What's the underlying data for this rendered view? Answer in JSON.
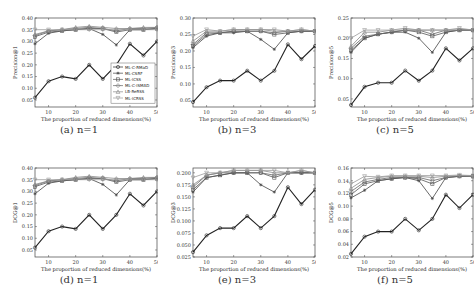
{
  "legend": [
    "ML-C-RMaD",
    "ML-CSRF",
    "ML-ICSS",
    "ML-C-ISMAD",
    "LB-ReRSS",
    "ML-ICRSS"
  ],
  "series_styles": [
    {
      "color": "#222222",
      "marker": "circle"
    },
    {
      "color": "#444444",
      "marker": "star"
    },
    {
      "color": "#555555",
      "marker": "square"
    },
    {
      "color": "#666666",
      "marker": "diamond"
    },
    {
      "color": "#888888",
      "marker": "triangle"
    },
    {
      "color": "#999999",
      "marker": "tri-down"
    }
  ],
  "chart_data": [
    {
      "type": "line",
      "id": "a",
      "caption": "(a)  n=1",
      "xlabel": "The proportion of reduced dimensions(%)",
      "ylabel": "Precision@1",
      "x": [
        5,
        10,
        15,
        20,
        25,
        30,
        35,
        40,
        45,
        50
      ],
      "xticks": [
        10,
        20,
        30,
        40,
        50
      ],
      "ylim": [
        0.02,
        0.4
      ],
      "yticks": [
        "0.05",
        "0.10",
        "0.15",
        "0.20",
        "0.25",
        "0.30",
        "0.35",
        "0.40"
      ],
      "yticks_val": [
        0.05,
        0.1,
        0.15,
        0.2,
        0.25,
        0.3,
        0.35,
        0.4
      ],
      "legend_shown": true,
      "series": [
        {
          "name": "ML-C-RMaD",
          "values": [
            0.06,
            0.13,
            0.15,
            0.14,
            0.2,
            0.14,
            0.2,
            0.29,
            0.24,
            0.3
          ]
        },
        {
          "name": "ML-CSRF",
          "values": [
            0.29,
            0.335,
            0.345,
            0.35,
            0.355,
            0.33,
            0.285,
            0.35,
            0.35,
            0.355
          ]
        },
        {
          "name": "ML-ICSS",
          "values": [
            0.32,
            0.34,
            0.345,
            0.35,
            0.355,
            0.355,
            0.34,
            0.35,
            0.35,
            0.355
          ]
        },
        {
          "name": "ML-C-ISMAD",
          "values": [
            0.325,
            0.345,
            0.35,
            0.355,
            0.36,
            0.355,
            0.345,
            0.355,
            0.355,
            0.36
          ]
        },
        {
          "name": "LB-ReRSS",
          "values": [
            0.33,
            0.345,
            0.35,
            0.36,
            0.365,
            0.36,
            0.355,
            0.355,
            0.36,
            0.36
          ]
        },
        {
          "name": "ML-ICRSS",
          "values": [
            0.35,
            0.35,
            0.35,
            0.35,
            0.35,
            0.35,
            0.35,
            0.35,
            0.35,
            0.35
          ]
        }
      ]
    },
    {
      "type": "line",
      "id": "b",
      "caption": "(b)  n=3",
      "xlabel": "The proportion of reduced dimensions(%)",
      "ylabel": "Precision@3",
      "x": [
        5,
        10,
        15,
        20,
        25,
        30,
        35,
        40,
        45,
        50
      ],
      "xticks": [
        10,
        20,
        30,
        40,
        50
      ],
      "ylim": [
        0.03,
        0.3
      ],
      "yticks": [
        "0.05",
        "0.10",
        "0.15",
        "0.20",
        "0.25",
        "0.30"
      ],
      "yticks_val": [
        0.05,
        0.1,
        0.15,
        0.2,
        0.25,
        0.3
      ],
      "legend_shown": false,
      "series": [
        {
          "name": "ML-C-RMaD",
          "values": [
            0.045,
            0.09,
            0.11,
            0.11,
            0.14,
            0.11,
            0.14,
            0.22,
            0.175,
            0.215
          ]
        },
        {
          "name": "ML-CSRF",
          "values": [
            0.21,
            0.245,
            0.255,
            0.255,
            0.26,
            0.235,
            0.205,
            0.255,
            0.26,
            0.26
          ]
        },
        {
          "name": "ML-ICSS",
          "values": [
            0.215,
            0.25,
            0.255,
            0.26,
            0.26,
            0.26,
            0.25,
            0.255,
            0.26,
            0.26
          ]
        },
        {
          "name": "ML-C-ISMAD",
          "values": [
            0.22,
            0.255,
            0.255,
            0.26,
            0.26,
            0.26,
            0.255,
            0.26,
            0.26,
            0.26
          ]
        },
        {
          "name": "LB-ReRSS",
          "values": [
            0.23,
            0.26,
            0.26,
            0.265,
            0.265,
            0.265,
            0.26,
            0.26,
            0.265,
            0.26
          ]
        },
        {
          "name": "ML-ICRSS",
          "values": [
            0.245,
            0.265,
            0.26,
            0.265,
            0.265,
            0.265,
            0.265,
            0.26,
            0.265,
            0.26
          ]
        }
      ]
    },
    {
      "type": "line",
      "id": "c",
      "caption": "(c)  n=5",
      "xlabel": "The proportion of reduced dimensions(%)",
      "ylabel": "Precision@5",
      "x": [
        5,
        10,
        15,
        20,
        25,
        30,
        35,
        40,
        45,
        50
      ],
      "xticks": [
        10,
        20,
        30,
        40,
        50
      ],
      "ylim": [
        0.03,
        0.25
      ],
      "yticks": [
        "0.05",
        "0.10",
        "0.15",
        "0.20",
        "0.25"
      ],
      "yticks_val": [
        0.05,
        0.1,
        0.15,
        0.2,
        0.25
      ],
      "legend_shown": false,
      "series": [
        {
          "name": "ML-C-RMaD",
          "values": [
            0.035,
            0.08,
            0.09,
            0.09,
            0.12,
            0.095,
            0.12,
            0.175,
            0.145,
            0.175
          ]
        },
        {
          "name": "ML-CSRF",
          "values": [
            0.165,
            0.2,
            0.21,
            0.215,
            0.215,
            0.2,
            0.165,
            0.215,
            0.22,
            0.22
          ]
        },
        {
          "name": "ML-ICSS",
          "values": [
            0.17,
            0.2,
            0.21,
            0.215,
            0.22,
            0.215,
            0.205,
            0.215,
            0.22,
            0.22
          ]
        },
        {
          "name": "ML-C-ISMAD",
          "values": [
            0.175,
            0.205,
            0.21,
            0.215,
            0.22,
            0.22,
            0.21,
            0.22,
            0.22,
            0.22
          ]
        },
        {
          "name": "LB-ReRSS",
          "values": [
            0.18,
            0.215,
            0.215,
            0.22,
            0.22,
            0.22,
            0.22,
            0.22,
            0.22,
            0.22
          ]
        },
        {
          "name": "ML-ICRSS",
          "values": [
            0.2,
            0.22,
            0.22,
            0.22,
            0.225,
            0.22,
            0.22,
            0.22,
            0.225,
            0.22
          ]
        }
      ]
    },
    {
      "type": "line",
      "id": "d",
      "caption": "(d)  n=1",
      "xlabel": "The proportion of reduced dimensions(%)",
      "ylabel": "DCG@1",
      "x": [
        5,
        10,
        15,
        20,
        25,
        30,
        35,
        40,
        45,
        50
      ],
      "xticks": [
        10,
        20,
        30,
        40,
        50
      ],
      "ylim": [
        0.02,
        0.4
      ],
      "yticks": [
        "0.05",
        "0.10",
        "0.15",
        "0.20",
        "0.25",
        "0.30",
        "0.35",
        "0.40"
      ],
      "yticks_val": [
        0.05,
        0.1,
        0.15,
        0.2,
        0.25,
        0.3,
        0.35,
        0.4
      ],
      "legend_shown": false,
      "series": [
        {
          "name": "ML-C-RMaD",
          "values": [
            0.06,
            0.13,
            0.15,
            0.14,
            0.2,
            0.14,
            0.2,
            0.29,
            0.24,
            0.3
          ]
        },
        {
          "name": "ML-CSRF",
          "values": [
            0.29,
            0.335,
            0.345,
            0.35,
            0.355,
            0.33,
            0.285,
            0.35,
            0.35,
            0.355
          ]
        },
        {
          "name": "ML-ICSS",
          "values": [
            0.32,
            0.34,
            0.345,
            0.35,
            0.355,
            0.355,
            0.34,
            0.35,
            0.35,
            0.355
          ]
        },
        {
          "name": "ML-C-ISMAD",
          "values": [
            0.325,
            0.345,
            0.35,
            0.355,
            0.36,
            0.355,
            0.345,
            0.355,
            0.355,
            0.36
          ]
        },
        {
          "name": "LB-ReRSS",
          "values": [
            0.33,
            0.345,
            0.35,
            0.36,
            0.365,
            0.36,
            0.355,
            0.355,
            0.36,
            0.36
          ]
        },
        {
          "name": "ML-ICRSS",
          "values": [
            0.35,
            0.35,
            0.35,
            0.35,
            0.35,
            0.35,
            0.35,
            0.35,
            0.35,
            0.35
          ]
        }
      ]
    },
    {
      "type": "line",
      "id": "e",
      "caption": "(e)  n=3",
      "xlabel": "The proportion of reduced dimensions(%)",
      "ylabel": "DCG@3",
      "x": [
        5,
        10,
        15,
        20,
        25,
        30,
        35,
        40,
        45,
        50
      ],
      "xticks": [
        10,
        20,
        30,
        40,
        50
      ],
      "ylim": [
        0.025,
        0.21
      ],
      "yticks": [
        "0.025",
        "0.050",
        "0.075",
        "0.100",
        "0.125",
        "0.150",
        "0.175",
        "0.200"
      ],
      "yticks_val": [
        0.025,
        0.05,
        0.075,
        0.1,
        0.125,
        0.15,
        0.175,
        0.2
      ],
      "legend_shown": false,
      "series": [
        {
          "name": "ML-C-RMaD",
          "values": [
            0.035,
            0.07,
            0.085,
            0.085,
            0.11,
            0.085,
            0.11,
            0.17,
            0.135,
            0.165
          ]
        },
        {
          "name": "ML-CSRF",
          "values": [
            0.16,
            0.19,
            0.195,
            0.2,
            0.2,
            0.175,
            0.16,
            0.2,
            0.2,
            0.2
          ]
        },
        {
          "name": "ML-ICSS",
          "values": [
            0.165,
            0.19,
            0.195,
            0.2,
            0.2,
            0.2,
            0.19,
            0.2,
            0.2,
            0.2
          ]
        },
        {
          "name": "ML-C-ISMAD",
          "values": [
            0.17,
            0.195,
            0.2,
            0.2,
            0.2,
            0.2,
            0.195,
            0.2,
            0.2,
            0.2
          ]
        },
        {
          "name": "LB-ReRSS",
          "values": [
            0.175,
            0.195,
            0.2,
            0.205,
            0.205,
            0.205,
            0.2,
            0.2,
            0.205,
            0.2
          ]
        },
        {
          "name": "ML-ICRSS",
          "values": [
            0.19,
            0.2,
            0.2,
            0.205,
            0.205,
            0.205,
            0.205,
            0.2,
            0.205,
            0.2
          ]
        }
      ]
    },
    {
      "type": "line",
      "id": "f",
      "caption": "(f)  n=5",
      "xlabel": "The proportion of reduced dimensions(%)",
      "ylabel": "DCG@5",
      "x": [
        5,
        10,
        15,
        20,
        25,
        30,
        35,
        40,
        45,
        50
      ],
      "xticks": [
        10,
        20,
        30,
        40,
        50
      ],
      "ylim": [
        0.02,
        0.16
      ],
      "yticks": [
        "0.02",
        "0.04",
        "0.06",
        "0.08",
        "0.10",
        "0.12",
        "0.14",
        "0.16"
      ],
      "yticks_val": [
        0.02,
        0.04,
        0.06,
        0.08,
        0.1,
        0.12,
        0.14,
        0.16
      ],
      "legend_shown": false,
      "series": [
        {
          "name": "ML-C-RMaD",
          "values": [
            0.025,
            0.052,
            0.06,
            0.06,
            0.08,
            0.062,
            0.08,
            0.118,
            0.097,
            0.118
          ]
        },
        {
          "name": "ML-CSRF",
          "values": [
            0.113,
            0.125,
            0.14,
            0.143,
            0.145,
            0.14,
            0.112,
            0.145,
            0.147,
            0.147
          ]
        },
        {
          "name": "ML-ICSS",
          "values": [
            0.118,
            0.135,
            0.14,
            0.143,
            0.145,
            0.143,
            0.135,
            0.145,
            0.147,
            0.147
          ]
        },
        {
          "name": "ML-C-ISMAD",
          "values": [
            0.123,
            0.138,
            0.142,
            0.145,
            0.145,
            0.145,
            0.14,
            0.145,
            0.147,
            0.147
          ]
        },
        {
          "name": "LB-ReRSS",
          "values": [
            0.128,
            0.142,
            0.145,
            0.147,
            0.147,
            0.147,
            0.145,
            0.147,
            0.148,
            0.147
          ]
        },
        {
          "name": "ML-ICRSS",
          "values": [
            0.135,
            0.147,
            0.146,
            0.148,
            0.148,
            0.148,
            0.148,
            0.148,
            0.149,
            0.148
          ]
        }
      ]
    }
  ]
}
